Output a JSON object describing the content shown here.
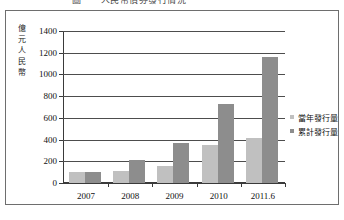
{
  "title": {
    "text": "圖一　人民幣債券發行情況",
    "cropped": true
  },
  "chart_data": {
    "type": "bar",
    "title": "",
    "xlabel": "",
    "ylabel": "億元人民幣",
    "ylabel_chars": [
      "億",
      "元",
      "人",
      "民",
      "幣"
    ],
    "categories": [
      "2007",
      "2008",
      "2009",
      "2010",
      "2011.6"
    ],
    "series": [
      {
        "name": "當年發行量",
        "color": "#c0c0c0",
        "values": [
          100,
          115,
          155,
          350,
          415
        ]
      },
      {
        "name": "累計發行量",
        "color": "#8d8d8d",
        "values": [
          100,
          215,
          370,
          730,
          1160
        ]
      }
    ],
    "ylim": [
      0,
      1400
    ],
    "ytick_step": 200,
    "yticks": [
      0,
      200,
      400,
      600,
      800,
      1000,
      1200,
      1400
    ],
    "ytick_labels": [
      "0",
      "200",
      "400",
      "600",
      "800",
      "1000",
      "1200",
      "1400"
    ],
    "grid": true,
    "grid_axis": "y",
    "legend_position": "right"
  },
  "legend": {
    "entries": [
      {
        "label": "當年發行量",
        "swatch": "legend-swatch-current-year"
      },
      {
        "label": "累計發行量",
        "swatch": "legend-swatch-cumulative"
      }
    ]
  }
}
